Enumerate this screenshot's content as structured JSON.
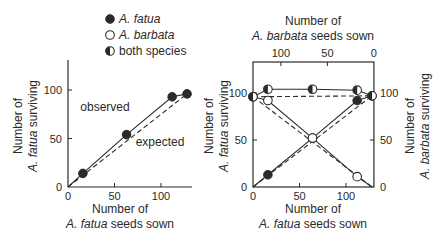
{
  "legend": {
    "items": [
      {
        "marker": "filled",
        "label": "A. fatua",
        "italic": true
      },
      {
        "marker": "open",
        "label": "A. barbata",
        "italic": true
      },
      {
        "marker": "half",
        "label": "both species",
        "italic": false
      }
    ]
  },
  "colors": {
    "ink": "#2a2a2a",
    "paper": "#ffffff"
  },
  "chart_data": [
    {
      "type": "line",
      "title": "",
      "xlabel": [
        "Number of",
        "A. fatua seeds sown"
      ],
      "ylabel": [
        "Number of",
        "A. fatua surviving"
      ],
      "xlim": [
        0,
        135
      ],
      "ylim": [
        0,
        120
      ],
      "xticks": [
        0,
        50,
        100
      ],
      "yticks": [
        0,
        50,
        100
      ],
      "grid": false,
      "annotations": [
        {
          "text": "observed",
          "x": 38,
          "y": 60
        },
        {
          "text": "expected",
          "x": 70,
          "y": 40
        }
      ],
      "series": [
        {
          "name": "observed",
          "style": "solid",
          "marker": "filled",
          "x": [
            0,
            16,
            63,
            112,
            128
          ],
          "y": [
            0,
            14,
            54,
            93,
            96
          ]
        },
        {
          "name": "expected",
          "style": "dashed",
          "marker": "none",
          "x": [
            0,
            128
          ],
          "y": [
            0,
            96
          ]
        }
      ]
    },
    {
      "type": "line",
      "title": "",
      "xlabel": [
        "Number of",
        "A. fatua seeds sown"
      ],
      "x2label": [
        "Number of",
        "A. barbata seeds sown"
      ],
      "ylabel": [
        "Number of",
        "A. fatua surviving"
      ],
      "y2label": [
        "Number of",
        "A. barbata surviving"
      ],
      "xlim": [
        0,
        130
      ],
      "x2lim": [
        130,
        0
      ],
      "ylim": [
        0,
        135
      ],
      "xticks": [
        0,
        50,
        100
      ],
      "x2ticks": [
        100,
        50,
        0
      ],
      "yticks": [
        0,
        50,
        100
      ],
      "y2ticks": [
        0,
        50,
        100
      ],
      "grid": false,
      "series": [
        {
          "name": "A. fatua observed",
          "style": "solid",
          "marker": "filled",
          "x": [
            0,
            16,
            64,
            112,
            128
          ],
          "y": [
            0,
            13,
            52,
            92,
            97
          ]
        },
        {
          "name": "A. fatua expected",
          "style": "dashed",
          "marker": "none",
          "x": [
            0,
            128
          ],
          "y": [
            0,
            97
          ]
        },
        {
          "name": "A. barbata observed",
          "style": "solid",
          "marker": "open",
          "x": [
            0,
            16,
            64,
            112,
            128
          ],
          "y": [
            96,
            92,
            52,
            11,
            0
          ]
        },
        {
          "name": "A. barbata expected",
          "style": "dashed",
          "marker": "none",
          "x": [
            0,
            128
          ],
          "y": [
            96,
            0
          ]
        },
        {
          "name": "both species observed",
          "style": "solid",
          "marker": "half",
          "x": [
            0,
            16,
            64,
            112,
            128
          ],
          "y": [
            96,
            104,
            104,
            103,
            97
          ]
        },
        {
          "name": "both species expected",
          "style": "dashed",
          "marker": "none",
          "x": [
            0,
            128
          ],
          "y": [
            96,
            97
          ]
        }
      ]
    }
  ]
}
